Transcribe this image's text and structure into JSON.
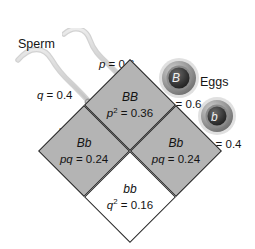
{
  "figure": {
    "background_color": "#ffffff",
    "shaded_cell_color": "#b4b4b4",
    "unshaded_cell_color": "#ffffff",
    "line_color": "#2a2a2a"
  },
  "gametes": {
    "sperm": {
      "label": "Sperm",
      "cells": [
        {
          "allele": "B",
          "frequency_label": "p = 0.6",
          "frequency_symbol": "p",
          "frequency_value": 0.6,
          "icon": "sperm-cell-icon"
        },
        {
          "allele": "b",
          "frequency_label": "q = 0.4",
          "frequency_symbol": "q",
          "frequency_value": 0.4,
          "icon": "sperm-cell-icon"
        }
      ]
    },
    "eggs": {
      "label": "Eggs",
      "cells": [
        {
          "allele": "B",
          "frequency_label": "p = 0.6",
          "frequency_symbol": "p",
          "frequency_value": 0.6,
          "icon": "egg-cell-icon"
        },
        {
          "allele": "b",
          "frequency_label": "q = 0.4",
          "frequency_symbol": "q",
          "frequency_value": 0.4,
          "icon": "egg-cell-icon"
        }
      ]
    }
  },
  "punnett": {
    "cells": [
      {
        "position": "top",
        "genotype": "BB",
        "frequency_symbol": "p",
        "frequency_exponent": "2",
        "frequency_value": "0.36",
        "shaded": true
      },
      {
        "position": "left",
        "genotype": "Bb",
        "frequency_symbol": "pq",
        "frequency_exponent": "",
        "frequency_value": "0.24",
        "shaded": true
      },
      {
        "position": "right",
        "genotype": "Bb",
        "frequency_symbol": "pq",
        "frequency_exponent": "",
        "frequency_value": "0.24",
        "shaded": true
      },
      {
        "position": "bottom",
        "genotype": "bb",
        "frequency_symbol": "q",
        "frequency_exponent": "2",
        "frequency_value": "0.16",
        "shaded": false
      }
    ]
  }
}
